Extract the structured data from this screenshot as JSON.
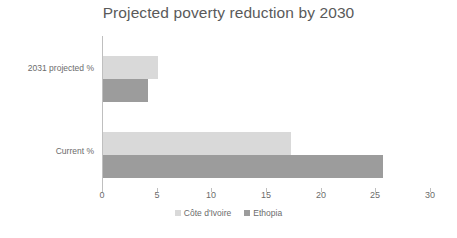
{
  "chart_data": {
    "type": "bar",
    "orientation": "horizontal",
    "title": "Projected poverty reduction by 2030",
    "xlabel": "",
    "ylabel": "",
    "categories": [
      "Current %",
      "2031 projected %"
    ],
    "series": [
      {
        "name": "Côte d'Ivoire",
        "color": "#d9d9d9",
        "values": [
          17.2,
          5.0
        ]
      },
      {
        "name": "Ethopia",
        "color": "#9c9c9c",
        "values": [
          25.6,
          4.1
        ]
      }
    ],
    "xlim": [
      0,
      30
    ],
    "xticks": [
      "0",
      "5",
      "10",
      "15",
      "20",
      "25",
      "30"
    ],
    "grid": false,
    "legend_position": "bottom"
  },
  "axis": {
    "tick_0": "0",
    "tick_1": "5",
    "tick_2": "10",
    "tick_3": "15",
    "tick_4": "20",
    "tick_5": "25",
    "tick_6": "30"
  },
  "category_labels": {
    "projected": "2031 projected %",
    "current": "Current %"
  },
  "legend": {
    "item_0": "Côte d'Ivoire",
    "item_1": "Ethopia"
  }
}
